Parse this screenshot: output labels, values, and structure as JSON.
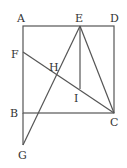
{
  "diagram": {
    "type": "geometry",
    "points": {
      "A": {
        "x": 23,
        "y": 26,
        "label": "A"
      },
      "D": {
        "x": 114,
        "y": 26,
        "label": "D"
      },
      "E": {
        "x": 80,
        "y": 26,
        "label": "E"
      },
      "F": {
        "x": 23,
        "y": 52,
        "label": "F"
      },
      "H": {
        "x": 57,
        "y": 76,
        "label": "H"
      },
      "I": {
        "x": 80,
        "y": 89,
        "label": "I"
      },
      "B": {
        "x": 23,
        "y": 113,
        "label": "B"
      },
      "C": {
        "x": 114,
        "y": 113,
        "label": "C"
      },
      "G": {
        "x": 23,
        "y": 145,
        "label": "G"
      }
    },
    "segments": [
      [
        "A",
        "D"
      ],
      [
        "D",
        "C"
      ],
      [
        "C",
        "B"
      ],
      [
        "B",
        "A"
      ],
      [
        "B",
        "G"
      ],
      [
        "F",
        "C"
      ],
      [
        "E",
        "C"
      ],
      [
        "E",
        "G"
      ],
      [
        "E",
        "I"
      ]
    ],
    "labels": {
      "A": "A",
      "B": "B",
      "C": "C",
      "D": "D",
      "E": "E",
      "F": "F",
      "G": "G",
      "H": "H",
      "I": "I"
    }
  }
}
